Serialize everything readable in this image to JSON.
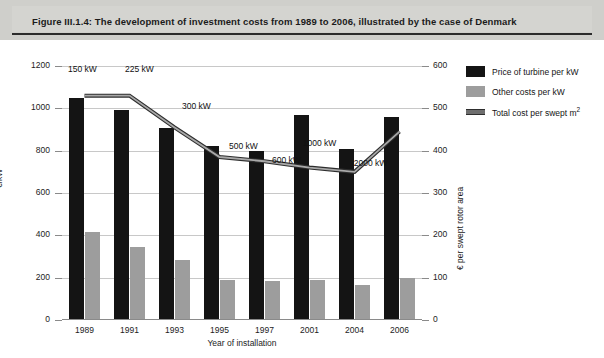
{
  "caption": "Figure III.1.4: The development of investment costs from 1989 to 2006, illustrated by the case of Denmark",
  "axes": {
    "x_title": "Year of installation",
    "y_left_title": "€/kW",
    "y_right_title": "€ per swept rotor area",
    "y_left_ticks": [
      "0",
      "200",
      "400",
      "600",
      "800",
      "1000",
      "1200"
    ],
    "y_right_ticks": [
      "0",
      "100",
      "200",
      "300",
      "400",
      "500",
      "600"
    ]
  },
  "legend": {
    "items": [
      {
        "label": "Price of turbine per kW",
        "swatch": "black-square",
        "color": "#141414"
      },
      {
        "label": "Other costs per kW",
        "swatch": "grey-square",
        "color": "#9d9d9d"
      },
      {
        "label": "Total cost per swept m",
        "label_sup": "2",
        "swatch": "grey-line",
        "color": "#6e6e6e"
      }
    ]
  },
  "chart_data": {
    "type": "bar",
    "title": "Figure III.1.4: The development of investment costs from 1989 to 2006, illustrated by the case of Denmark",
    "xlabel": "Year of installation",
    "ylabel": "€/kW",
    "y2label": "€ per swept rotor area",
    "ylim": [
      0,
      1200
    ],
    "y2lim": [
      0,
      600
    ],
    "ytick_step": 200,
    "y2tick_step": 100,
    "grid": true,
    "legend_position": "right",
    "categories": [
      "1989",
      "1991",
      "1993",
      "1995",
      "1997",
      "2001",
      "2004",
      "2006"
    ],
    "series": [
      {
        "name": "Price of turbine per kW",
        "type": "bar",
        "axis": "left",
        "color": "#141414",
        "values": [
          1050,
          990,
          905,
          820,
          800,
          970,
          810,
          960
        ]
      },
      {
        "name": "Other costs per kW",
        "type": "bar",
        "axis": "left",
        "color": "#9d9d9d",
        "values": [
          415,
          345,
          285,
          190,
          185,
          190,
          165,
          200
        ]
      },
      {
        "name": "Total cost per swept m2",
        "type": "line",
        "axis": "right",
        "color": "#6e6e6e",
        "values": [
          530,
          530,
          455,
          385,
          375,
          360,
          350,
          445
        ]
      }
    ],
    "annotations": [
      {
        "text": "150 kW",
        "category": "1989"
      },
      {
        "text": "225 kW",
        "category": "1991"
      },
      {
        "text": "300 kW",
        "category": "1993"
      },
      {
        "text": "500 kW",
        "category": "1995"
      },
      {
        "text": "600 kW",
        "category": "1997"
      },
      {
        "text": "1000 kW",
        "category": "2001"
      },
      {
        "text": "2000 kW",
        "category": "2004"
      }
    ]
  }
}
